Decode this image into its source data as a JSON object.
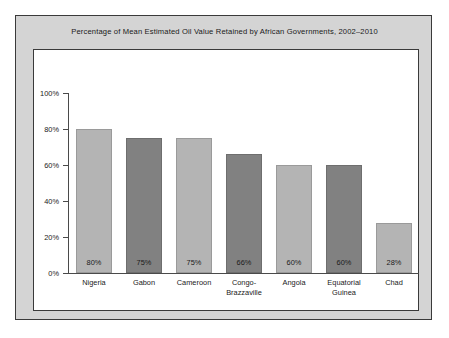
{
  "chart_data": {
    "type": "bar",
    "title": "Percentage of Mean Estimated Oil Value Retained by African Governments, 2002–2010",
    "xlabel": "",
    "ylabel": "",
    "categories": [
      "Nigeria",
      "Gabon",
      "Cameroon",
      "Congo-Brazzaville",
      "Angola",
      "Equatorial Guinea",
      "Chad"
    ],
    "values": [
      80,
      75,
      75,
      66,
      60,
      60,
      28
    ],
    "value_labels": [
      "80%",
      "75%",
      "75%",
      "66%",
      "60%",
      "60%",
      "28%"
    ],
    "ylim": [
      0,
      100
    ],
    "ytick_values": [
      0,
      20,
      40,
      60,
      80,
      100
    ],
    "ytick_labels": [
      "0%",
      "20%",
      "40%",
      "60%",
      "80%",
      "100%"
    ],
    "grid": false,
    "legend": "none",
    "bar_shades": [
      "light",
      "dark",
      "light",
      "dark",
      "light",
      "dark",
      "light"
    ],
    "colors": {
      "bar_light": "#b4b4b4",
      "bar_dark": "#818181",
      "panel_background": "#d4d4d4",
      "plot_background": "#ffffff",
      "axis": "#4a4a4a",
      "border": "#3a3a3a",
      "text": "#1a1a1a"
    }
  },
  "categories_display": [
    [
      "Nigeria"
    ],
    [
      "Gabon"
    ],
    [
      "Cameroon"
    ],
    [
      "Congo-",
      "Brazzaville"
    ],
    [
      "Angola"
    ],
    [
      "Equatorial",
      "Guinea"
    ],
    [
      "Chad"
    ]
  ]
}
